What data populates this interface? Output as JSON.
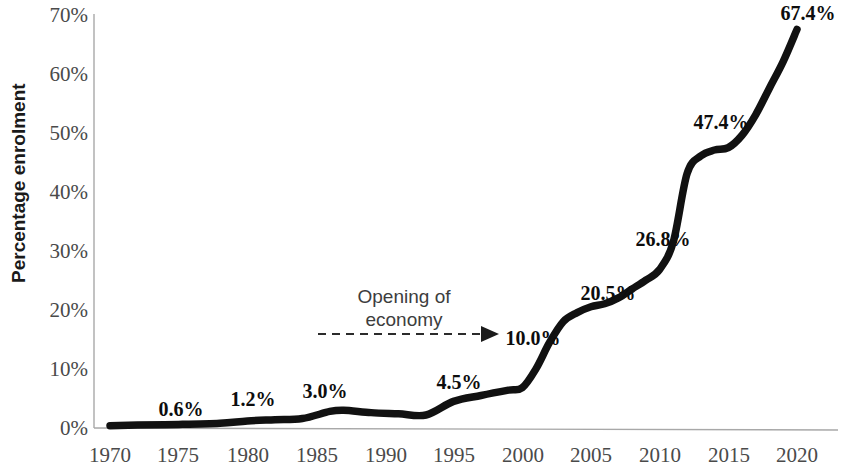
{
  "chart_data": {
    "type": "line",
    "title": "",
    "xlabel": "",
    "ylabel": "Percentage enrolment",
    "xlim": [
      1970,
      2020
    ],
    "ylim": [
      0,
      70
    ],
    "grid": false,
    "legend": "none",
    "x_ticks": [
      "1970",
      "1975",
      "1980",
      "1985",
      "1990",
      "1995",
      "2000",
      "2005",
      "2010",
      "2015",
      "2020"
    ],
    "y_ticks": [
      "0%",
      "10%",
      "20%",
      "30%",
      "40%",
      "50%",
      "60%",
      "70%"
    ],
    "series": [
      {
        "name": "Percentage enrolment",
        "color": "#111111",
        "x": [
          1970,
          1972,
          1975,
          1978,
          1980,
          1982,
          1984,
          1986,
          1987,
          1989,
          1991,
          1993,
          1995,
          1997,
          1999,
          2000,
          2001,
          2002,
          2003,
          2004,
          2005,
          2006,
          2007,
          2008,
          2009,
          2010,
          2011,
          2012,
          2013,
          2014,
          2015,
          2016,
          2017,
          2018,
          2019,
          2020
        ],
        "y": [
          0.4,
          0.5,
          0.6,
          0.8,
          1.2,
          1.4,
          1.6,
          2.8,
          3.0,
          2.6,
          2.4,
          2.2,
          4.5,
          5.5,
          6.4,
          6.8,
          10.0,
          14.5,
          18.0,
          19.5,
          20.5,
          21.0,
          22.0,
          23.5,
          25.0,
          26.8,
          31.5,
          43.0,
          46.0,
          47.0,
          47.4,
          49.5,
          53.0,
          57.5,
          62.0,
          67.4
        ]
      }
    ],
    "point_labels": [
      {
        "text": "0.6%",
        "x": 1975,
        "y": 0.6
      },
      {
        "text": "1.2%",
        "x": 1980,
        "y": 1.2
      },
      {
        "text": "3.0%",
        "x": 1985,
        "y": 3.0
      },
      {
        "text": "4.5%",
        "x": 1995,
        "y": 4.5
      },
      {
        "text": "10.0%",
        "x": 2000,
        "y": 10.0
      },
      {
        "text": "20.5%",
        "x": 2005,
        "y": 20.5
      },
      {
        "text": "26.8%",
        "x": 2010,
        "y": 26.8
      },
      {
        "text": "47.4%",
        "x": 2015,
        "y": 47.4
      },
      {
        "text": "67.4%",
        "x": 2020,
        "y": 67.4
      }
    ],
    "annotations": [
      {
        "id": "opening-of-economy",
        "line1": "Opening of",
        "line2": "economy",
        "arrow_from_x": 1988.5,
        "arrow_to_x": 1999.0,
        "arrow_y": 8.0
      }
    ]
  },
  "labels": {
    "p0": "0.6%",
    "p1": "1.2%",
    "p2": "3.0%",
    "p3": "4.5%",
    "p4": "10.0%",
    "p5": "20.5%",
    "p6": "26.8%",
    "p7": "47.4%",
    "p8": "67.4%"
  },
  "axis": {
    "y_title": "Percentage enrolment",
    "y0": "0%",
    "y10": "10%",
    "y20": "20%",
    "y30": "30%",
    "y40": "40%",
    "y50": "50%",
    "y60": "60%",
    "y70": "70%",
    "x1970": "1970",
    "x1975": "1975",
    "x1980": "1980",
    "x1985": "1985",
    "x1990": "1990",
    "x1995": "1995",
    "x2000": "2000",
    "x2005": "2005",
    "x2010": "2010",
    "x2015": "2015",
    "x2020": "2020"
  },
  "annotation": {
    "line1": "Opening of",
    "line2": "economy"
  },
  "colors": {
    "line": "#111111",
    "axis": "#a8a8a8",
    "tick_text": "#4a4a4a",
    "label_text": "#0d0d0d",
    "annotation_text": "#3d3d3d",
    "background": "#ffffff"
  }
}
